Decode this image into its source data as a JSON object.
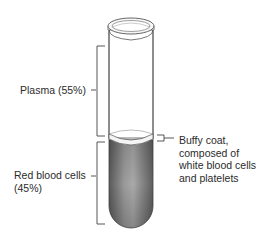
{
  "diagram": {
    "labels": {
      "plasma": "Plasma (55%)",
      "buffy_coat": [
        "Buffy coat,",
        "composed of",
        "white blood cells",
        "and platelets"
      ],
      "red_blood_cells": [
        "Red blood cells",
        "(45%)"
      ]
    },
    "components": [
      {
        "name": "Plasma",
        "percent": 55,
        "color": "#ffffff"
      },
      {
        "name": "Buffy coat",
        "percent": null,
        "color": "#f4f4f4"
      },
      {
        "name": "Red blood cells",
        "percent": 45,
        "color": "#7a7a7a"
      }
    ],
    "colors": {
      "outline": "#555555",
      "rbc_dark": "#555555",
      "rbc_light": "#a8a8a8",
      "text": "#2b2b2b"
    }
  }
}
